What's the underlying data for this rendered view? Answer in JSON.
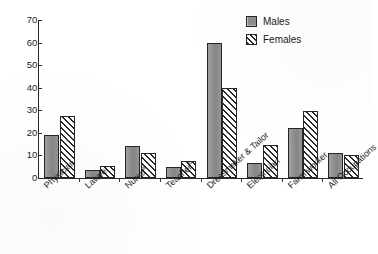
{
  "chart_data": {
    "type": "bar",
    "title": "",
    "subtitle": "",
    "xlabel": "",
    "ylabel": "",
    "ylim": [
      0,
      70
    ],
    "yticks": [
      0,
      10,
      20,
      30,
      40,
      50,
      60,
      70
    ],
    "grid": false,
    "legend_position": "top-right",
    "categories": [
      "Physician",
      "Lawyer",
      "Nurse",
      "Teacher",
      "Dressmaker & Tailor",
      "Electrician",
      "Farm worker",
      "All Occupations"
    ],
    "category_footnotes": [
      "",
      "",
      "a",
      "b",
      "",
      "",
      "",
      ""
    ],
    "series": [
      {
        "name": "Males",
        "fill": "solid-gray",
        "color": "#8d8d8d",
        "values": [
          19,
          3.5,
          14,
          5,
          60,
          6.5,
          22,
          11
        ]
      },
      {
        "name": "Females",
        "fill": "diagonal-hatch",
        "color": "#2b2b2b",
        "values": [
          27.5,
          5.5,
          11,
          7.5,
          40,
          14.5,
          29.5,
          10
        ]
      }
    ]
  },
  "legend": {
    "entries": [
      {
        "label": "Males",
        "swatch": "solid-gray-swatch"
      },
      {
        "label": "Females",
        "swatch": "diagonal-hatch-swatch"
      }
    ]
  },
  "axes": {
    "y_tick_labels": [
      "0",
      "10",
      "20",
      "30",
      "40",
      "50",
      "60",
      "70"
    ]
  }
}
